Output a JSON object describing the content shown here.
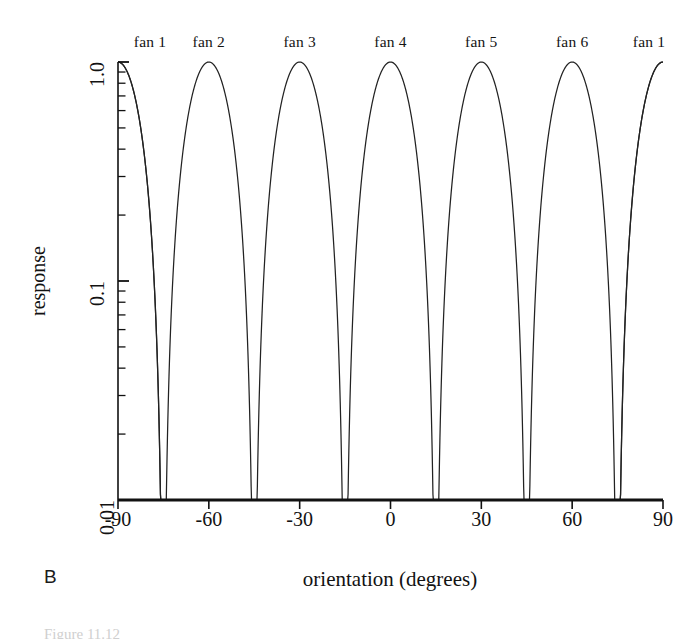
{
  "figure": {
    "panel_label": "B",
    "caption_partial": "Figure 11.12"
  },
  "axes": {
    "xlabel": "orientation (degrees)",
    "ylabel": "response",
    "xticks": [
      "-90",
      "-60",
      "-30",
      "0",
      "30",
      "60",
      "90"
    ],
    "yticks": [
      "1.0",
      "0.1",
      "0.01"
    ]
  },
  "fan_labels": [
    "fan 1",
    "fan 2",
    "fan 3",
    "fan 4",
    "fan 5",
    "fan 6",
    "fan 1"
  ],
  "chart_data": {
    "type": "line",
    "title": "",
    "subtitle": "",
    "xlabel": "orientation (degrees)",
    "ylabel": "response",
    "xlim": [
      -90,
      90
    ],
    "ylim": [
      0.01,
      1.0
    ],
    "yscale": "log",
    "xscale": "linear",
    "xticks": [
      -90,
      -60,
      -30,
      0,
      30,
      60,
      90
    ],
    "yticks": [
      1.0,
      0.1,
      0.01
    ],
    "grid": false,
    "legend": false,
    "legend_position": "above-axes",
    "annotations": [
      {
        "text": "fan 1",
        "x": -90,
        "position": "top"
      },
      {
        "text": "fan 2",
        "x": -60,
        "position": "top"
      },
      {
        "text": "fan 3",
        "x": -30,
        "position": "top"
      },
      {
        "text": "fan 4",
        "x": 0,
        "position": "top"
      },
      {
        "text": "fan 5",
        "x": 30,
        "position": "top"
      },
      {
        "text": "fan 6",
        "x": 60,
        "position": "top"
      },
      {
        "text": "fan 1",
        "x": 90,
        "position": "top"
      }
    ],
    "series": [
      {
        "name": "fan 1",
        "peak_x": -90,
        "peak_y": 1.0,
        "half_width_deg": 15,
        "crossing_y": 0.5,
        "floor_y": 0.01
      },
      {
        "name": "fan 2",
        "peak_x": -60,
        "peak_y": 1.0,
        "half_width_deg": 15,
        "crossing_y": 0.5,
        "floor_y": 0.01
      },
      {
        "name": "fan 3",
        "peak_x": -30,
        "peak_y": 1.0,
        "half_width_deg": 15,
        "crossing_y": 0.5,
        "floor_y": 0.01
      },
      {
        "name": "fan 4",
        "peak_x": 0,
        "peak_y": 1.0,
        "half_width_deg": 15,
        "crossing_y": 0.5,
        "floor_y": 0.01
      },
      {
        "name": "fan 5",
        "peak_x": 30,
        "peak_y": 1.0,
        "half_width_deg": 15,
        "crossing_y": 0.5,
        "floor_y": 0.01
      },
      {
        "name": "fan 6",
        "peak_x": 60,
        "peak_y": 1.0,
        "half_width_deg": 15,
        "crossing_y": 0.5,
        "floor_y": 0.01
      },
      {
        "name": "fan 1 (wrap)",
        "peak_x": 90,
        "peak_y": 1.0,
        "half_width_deg": 15,
        "crossing_y": 0.5,
        "floor_y": 0.01
      }
    ],
    "colors": {
      "line": "#222222",
      "axis": "#111111",
      "background": "#ffffff"
    }
  }
}
